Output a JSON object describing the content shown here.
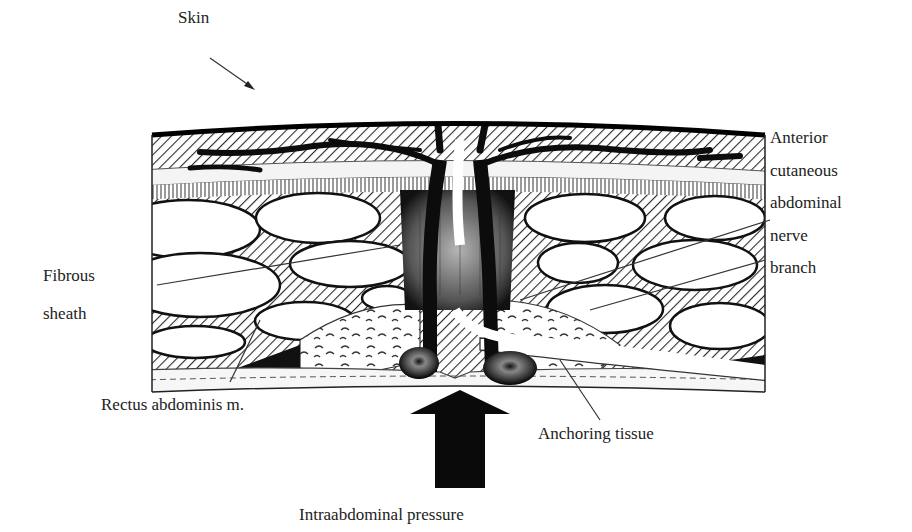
{
  "figure": {
    "type": "anatomical cross-section",
    "colors": {
      "ink": "#111111",
      "paper": "#ffffff",
      "hatch": "#2a2a2a",
      "grey": "#6b6b6b"
    }
  },
  "labels": {
    "skin": "Skin",
    "nerve": [
      "Anterior",
      "cutaneous",
      "abdominal",
      "nerve",
      "branch"
    ],
    "fibrous_sheath": [
      "Fibrous",
      "sheath"
    ],
    "rectus": "Rectus abdominis m.",
    "anchoring": "Anchoring tissue",
    "pressure": "Intraabdominal pressure"
  }
}
